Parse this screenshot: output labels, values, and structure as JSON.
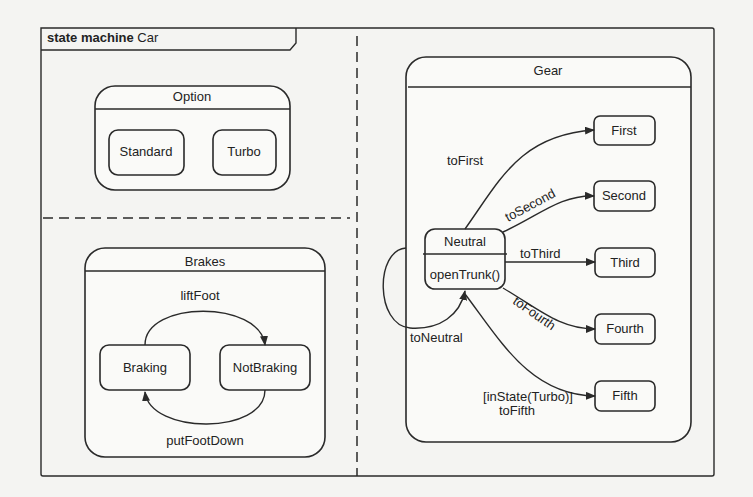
{
  "diagram": {
    "frame": {
      "keyword": "state machine",
      "name": "Car"
    },
    "regions": {
      "option": {
        "title": "Option",
        "states": [
          "Standard",
          "Turbo"
        ]
      },
      "brakes": {
        "title": "Brakes",
        "states": [
          "Braking",
          "NotBraking"
        ],
        "transitions": {
          "liftFoot": "liftFoot",
          "putFootDown": "putFootDown"
        }
      },
      "gear": {
        "title": "Gear",
        "neutral": {
          "name": "Neutral",
          "action": "openTrunk()"
        },
        "states": [
          "First",
          "Second",
          "Third",
          "Fourth",
          "Fifth"
        ],
        "transitions": {
          "toFirst": "toFirst",
          "toSecond": "toSecond",
          "toThird": "toThird",
          "toFourth": "toFourth",
          "toFifth_guard": "[inState(Turbo)]",
          "toFifth": "toFifth",
          "toNeutral": "toNeutral"
        }
      }
    }
  }
}
